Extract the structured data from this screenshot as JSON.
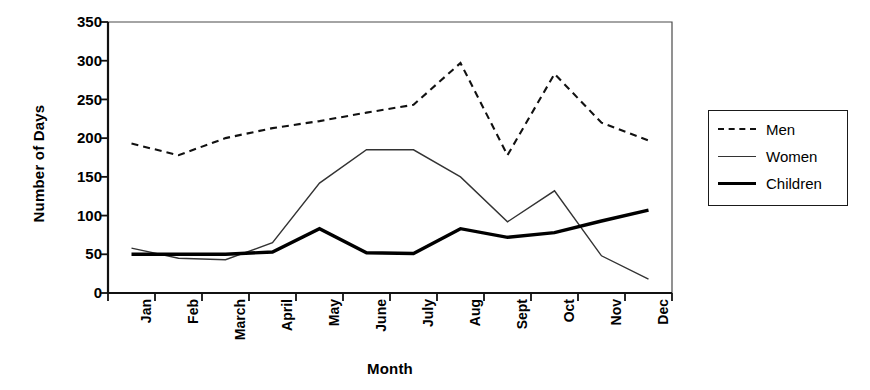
{
  "chart_data": {
    "type": "line",
    "title": "",
    "xlabel": "Month",
    "ylabel": "Number of Days",
    "categories": [
      "Jan",
      "Feb",
      "March",
      "April",
      "May",
      "June",
      "July",
      "Aug",
      "Sept",
      "Oct",
      "Nov",
      "Dec"
    ],
    "ylim": [
      0,
      350
    ],
    "yticks": [
      0,
      50,
      100,
      150,
      200,
      250,
      300,
      350
    ],
    "ytick_labels": [
      "0",
      "50",
      "100",
      "150",
      "200",
      "250",
      "300",
      "350"
    ],
    "grid": false,
    "legend_position": "right-outside",
    "series": [
      {
        "name": "Men",
        "style": "dashed",
        "color": "#111111",
        "values": [
          193,
          178,
          200,
          213,
          222,
          233,
          243,
          297,
          178,
          283,
          220,
          197
        ]
      },
      {
        "name": "Women",
        "style": "thin-solid",
        "color": "#333333",
        "values": [
          58,
          45,
          43,
          65,
          142,
          185,
          185,
          150,
          92,
          132,
          48,
          18
        ]
      },
      {
        "name": "Children",
        "style": "thick-solid",
        "color": "#000000",
        "values": [
          50,
          50,
          50,
          53,
          83,
          52,
          51,
          83,
          72,
          78,
          93,
          107
        ]
      }
    ]
  },
  "legend": {
    "items": [
      {
        "label": "Men"
      },
      {
        "label": "Women"
      },
      {
        "label": "Children"
      }
    ]
  }
}
